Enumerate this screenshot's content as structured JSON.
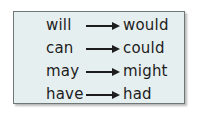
{
  "table": {
    "title": "",
    "rows": [
      {
        "from": "will",
        "to": "would"
      },
      {
        "from": "can",
        "to": "could"
      },
      {
        "from": "may",
        "to": "might"
      },
      {
        "from": "have",
        "to": "had"
      }
    ]
  },
  "colors": {
    "box_fill": "#e6eff0",
    "box_border": "#6f7676",
    "text": "#1d1d1d"
  }
}
